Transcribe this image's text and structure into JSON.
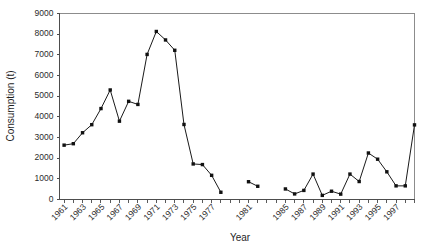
{
  "chart_data": {
    "type": "line",
    "title": "",
    "subtitle": "",
    "xlabel": "Year",
    "ylabel": "Consumption (t)",
    "xlim": [
      1960.5,
      1999.0
    ],
    "ylim": [
      0,
      9000
    ],
    "grid": false,
    "legend": null,
    "legend_position": "none",
    "marker": "filled-square",
    "line_color": "#1a1a1a",
    "marker_color": "#111111",
    "ytick_labels": [
      "0",
      "1000",
      "2000",
      "3000",
      "4000",
      "5000",
      "6000",
      "7000",
      "8000",
      "9000"
    ],
    "ytick_values": [
      0,
      1000,
      2000,
      3000,
      4000,
      5000,
      6000,
      7000,
      8000,
      9000
    ],
    "xtick_labels": [
      "1961",
      "1963",
      "1965",
      "1967",
      "1969",
      "1971",
      "1973",
      "1975",
      "1977",
      "1981",
      "1985",
      "1987",
      "1989",
      "1991",
      "1993",
      "1995",
      "1997"
    ],
    "xtick_values": [
      1961,
      1963,
      1965,
      1967,
      1969,
      1971,
      1973,
      1975,
      1977,
      1981,
      1985,
      1987,
      1989,
      1991,
      1993,
      1995,
      1997
    ],
    "x": [
      1961,
      1962,
      1963,
      1964,
      1965,
      1966,
      1967,
      1968,
      1969,
      1970,
      1971,
      1972,
      1973,
      1974,
      1975,
      1976,
      1977,
      1978,
      1979,
      1981,
      1982,
      1985,
      1986,
      1987,
      1988,
      1989,
      1990,
      1991,
      1992,
      1993,
      1994,
      1995,
      1996,
      1997,
      1998
    ],
    "values": [
      2630,
      2700,
      3230,
      3620,
      4400,
      5300,
      3790,
      4750,
      4600,
      7020,
      8130,
      7720,
      7220,
      3630,
      1720,
      1690,
      1170,
      350,
      null,
      860,
      640,
      510,
      270,
      440,
      1230,
      200,
      400,
      260,
      1230,
      870,
      2250,
      1950,
      1340,
      660,
      660
    ],
    "segments": [
      {
        "name": "1961-1979",
        "points": [
          {
            "year": 1961,
            "value": 2630
          },
          {
            "year": 1962,
            "value": 2700
          },
          {
            "year": 1963,
            "value": 3230
          },
          {
            "year": 1964,
            "value": 3620
          },
          {
            "year": 1965,
            "value": 4400
          },
          {
            "year": 1966,
            "value": 5300
          },
          {
            "year": 1967,
            "value": 3790
          },
          {
            "year": 1968,
            "value": 4750
          },
          {
            "year": 1969,
            "value": 4600
          },
          {
            "year": 1970,
            "value": 7020
          },
          {
            "year": 1971,
            "value": 8130
          },
          {
            "year": 1972,
            "value": 7720
          },
          {
            "year": 1973,
            "value": 7220
          },
          {
            "year": 1974,
            "value": 3630
          },
          {
            "year": 1975,
            "value": 1720
          },
          {
            "year": 1976,
            "value": 1690
          },
          {
            "year": 1977,
            "value": 1170
          },
          {
            "year": 1978,
            "value": 350
          }
        ]
      },
      {
        "name": "1981-1982",
        "points": [
          {
            "year": 1981,
            "value": 860
          },
          {
            "year": 1982,
            "value": 640
          }
        ]
      },
      {
        "name": "1985-1999",
        "points": [
          {
            "year": 1985,
            "value": 510
          },
          {
            "year": 1986,
            "value": 270
          },
          {
            "year": 1987,
            "value": 440
          },
          {
            "year": 1988,
            "value": 1230
          },
          {
            "year": 1989,
            "value": 200
          },
          {
            "year": 1990,
            "value": 400
          },
          {
            "year": 1991,
            "value": 260
          },
          {
            "year": 1992,
            "value": 1230
          },
          {
            "year": 1993,
            "value": 870
          },
          {
            "year": 1994,
            "value": 2250
          },
          {
            "year": 1995,
            "value": 1950
          },
          {
            "year": 1996,
            "value": 1340
          },
          {
            "year": 1997,
            "value": 660
          },
          {
            "year": 1998,
            "value": 660
          },
          {
            "year": 1999,
            "value": 3610
          }
        ]
      }
    ]
  },
  "axes": {
    "y_title": "Consumption (t)",
    "x_title": "Year"
  }
}
